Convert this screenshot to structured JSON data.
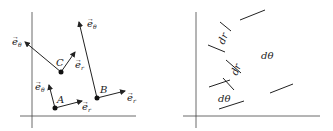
{
  "left_panel": {
    "name": "unit-vectors-panel",
    "points": [
      {
        "label": "A",
        "x": 55,
        "y": 108,
        "er": [
          82,
          101
        ],
        "eth": [
          49,
          85
        ],
        "er_label": "e",
        "er_sub": "r",
        "eth_label": "e",
        "eth_sub": "θ"
      },
      {
        "label": "B",
        "x": 97,
        "y": 98,
        "er": [
          125,
          91
        ],
        "eth": [
          79,
          22
        ],
        "er_label": "e",
        "er_sub": "r",
        "eth_label": "e",
        "eth_sub": "θ"
      },
      {
        "label": "C",
        "x": 61,
        "y": 72,
        "er": [
          75,
          52
        ],
        "eth": [
          25,
          42
        ],
        "er_label": "e",
        "er_sub": "r",
        "eth_label": "e",
        "eth_sub": "θ"
      }
    ]
  },
  "right_panel": {
    "name": "differential-elements-panel",
    "labels": [
      {
        "text": "dr",
        "x": 222,
        "y": 42,
        "rotate": -68
      },
      {
        "text": "dr",
        "x": 235,
        "y": 72,
        "rotate": -68
      },
      {
        "text": "dθ",
        "x": 263,
        "y": 57,
        "rotate": 0
      },
      {
        "text": "dθ",
        "x": 220,
        "y": 101,
        "rotate": 0
      }
    ]
  }
}
